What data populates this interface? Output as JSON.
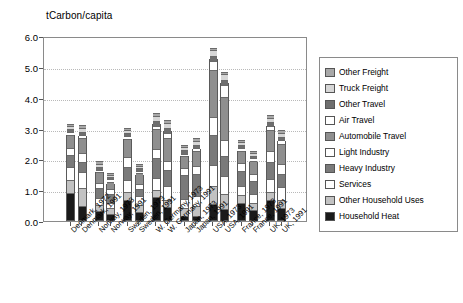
{
  "chart_data": {
    "type": "bar",
    "title": "",
    "ylabel": "tCarbon/capita",
    "xlabel": "",
    "ylim": [
      0.0,
      6.0
    ],
    "yticks": [
      "0.0",
      "1.0",
      "2.0",
      "3.0",
      "4.0",
      "5.0",
      "6.0"
    ],
    "grid": true,
    "stacked": true,
    "legend_position": "right",
    "categories": [
      "Denmark, 1972",
      "Denmark, 1991",
      "Norway, 1973",
      "Norway, 1991",
      "Sweden, 1973",
      "Sweden, 1991",
      "W. Germany, 1973",
      "W. Germany, 1991",
      "Japan, 1973",
      "Japan, 1991",
      "USA, 1973",
      "USA, 1991",
      "France, 1973",
      "France, 1991",
      "UK, 1973",
      "UK, 1991"
    ],
    "series": [
      {
        "name": "Household Heat",
        "color": "#1a1a1a",
        "values": [
          0.83,
          0.42,
          0.25,
          0.17,
          0.63,
          0.22,
          0.7,
          0.38,
          0.1,
          0.1,
          0.48,
          0.32,
          0.52,
          0.3,
          0.62,
          0.36
        ]
      },
      {
        "name": "Other Household Uses",
        "color": "#c2c2c2",
        "values": [
          0.4,
          0.55,
          0.17,
          0.14,
          0.22,
          0.2,
          0.2,
          0.22,
          0.22,
          0.28,
          0.55,
          0.45,
          0.22,
          0.2,
          0.22,
          0.24
        ]
      },
      {
        "name": "Services",
        "color": "#ffffff",
        "values": [
          0.4,
          0.48,
          0.2,
          0.14,
          0.34,
          0.25,
          0.36,
          0.4,
          0.26,
          0.3,
          0.65,
          0.55,
          0.26,
          0.26,
          0.4,
          0.36
        ]
      },
      {
        "name": "Heavy Industry",
        "color": "#7a7a7a",
        "values": [
          0.34,
          0.3,
          0.3,
          0.28,
          0.4,
          0.22,
          0.62,
          0.48,
          0.75,
          0.68,
          0.95,
          0.62,
          0.46,
          0.38,
          0.52,
          0.4
        ]
      },
      {
        "name": "Light Industry",
        "color": "#ffffff",
        "values": [
          0.22,
          0.26,
          0.13,
          0.1,
          0.28,
          0.13,
          0.26,
          0.28,
          0.2,
          0.24,
          0.55,
          0.48,
          0.22,
          0.2,
          0.32,
          0.28
        ]
      },
      {
        "name": "Automobile Travel",
        "color": "#8f8f8f",
        "values": [
          0.38,
          0.45,
          0.3,
          0.22,
          0.55,
          0.3,
          0.62,
          0.72,
          0.36,
          0.44,
          1.48,
          1.38,
          0.38,
          0.38,
          0.65,
          0.62
        ]
      },
      {
        "name": "Air Travel",
        "color": "#ffffff",
        "values": [
          0.05,
          0.08,
          0.05,
          0.04,
          0.08,
          0.05,
          0.06,
          0.12,
          0.04,
          0.07,
          0.26,
          0.34,
          0.05,
          0.06,
          0.1,
          0.12
        ]
      },
      {
        "name": "Other Travel",
        "color": "#6e6e6e",
        "values": [
          0.08,
          0.07,
          0.06,
          0.04,
          0.06,
          0.05,
          0.12,
          0.12,
          0.07,
          0.08,
          0.14,
          0.14,
          0.06,
          0.05,
          0.08,
          0.07
        ]
      },
      {
        "name": "Truck Freight",
        "color": "#d6d6d6",
        "values": [
          0.06,
          0.08,
          0.08,
          0.04,
          0.06,
          0.04,
          0.14,
          0.14,
          0.07,
          0.08,
          0.15,
          0.16,
          0.06,
          0.05,
          0.1,
          0.09
        ]
      },
      {
        "name": "Other Freight",
        "color": "#a8a8a8",
        "values": [
          0.04,
          0.06,
          0.06,
          0.03,
          0.05,
          0.04,
          0.07,
          0.06,
          0.05,
          0.06,
          0.04,
          0.05,
          0.05,
          0.04,
          0.07,
          0.06
        ]
      }
    ]
  },
  "legend": {
    "items": [
      {
        "label": "Other Freight",
        "color": "#a8a8a8"
      },
      {
        "label": "Truck Freight",
        "color": "#d6d6d6"
      },
      {
        "label": "Other Travel",
        "color": "#6e6e6e"
      },
      {
        "label": "Air Travel",
        "color": "#ffffff"
      },
      {
        "label": "Automobile Travel",
        "color": "#8f8f8f"
      },
      {
        "label": "Light Industry",
        "color": "#ffffff"
      },
      {
        "label": "Heavy Industry",
        "color": "#7a7a7a"
      },
      {
        "label": "Services",
        "color": "#ffffff"
      },
      {
        "label": "Other Household Uses",
        "color": "#c2c2c2"
      },
      {
        "label": "Household Heat",
        "color": "#1a1a1a"
      }
    ]
  }
}
